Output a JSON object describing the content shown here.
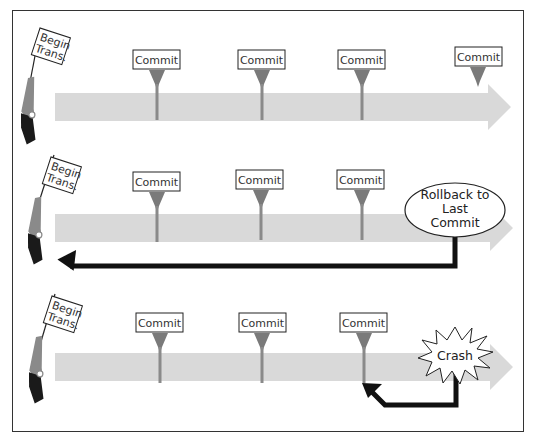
{
  "colors": {
    "timeline": "#d9d9d9",
    "commit_marker": "#7a7a7a",
    "return_arrow": "#111111",
    "border": "#333333"
  },
  "rows": [
    {
      "name": "normal-transaction",
      "begin_flag": {
        "line1": "Begin",
        "line2": "Trans."
      },
      "commits": [
        {
          "label": "Commit"
        },
        {
          "label": "Commit"
        },
        {
          "label": "Commit"
        },
        {
          "label": "Commit"
        }
      ]
    },
    {
      "name": "rollback-transaction",
      "begin_flag": {
        "line1": "Begin",
        "line2": "Trans."
      },
      "commits": [
        {
          "label": "Commit"
        },
        {
          "label": "Commit"
        },
        {
          "label": "Commit"
        }
      ],
      "event": {
        "line1": "Rollback to",
        "line2": "Last",
        "line3": "Commit"
      }
    },
    {
      "name": "crash-transaction",
      "begin_flag": {
        "line1": "Begin",
        "line2": "Trans."
      },
      "commits": [
        {
          "label": "Commit"
        },
        {
          "label": "Commit"
        },
        {
          "label": "Commit"
        }
      ],
      "event": {
        "line1": "Crash"
      }
    }
  ]
}
